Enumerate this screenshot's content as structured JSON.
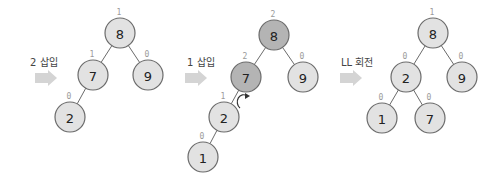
{
  "colors": {
    "node_fill": "#e2e2e2",
    "node_fill_unbalanced": "#b4b4b4",
    "edge": "#6b6b6b",
    "balance_factor_text": "#9a9a9a",
    "step_arrow": "#d4d4d4"
  },
  "steps": [
    {
      "label": "2 삽입",
      "nodes": [
        {
          "id": "p1-8",
          "value": "8",
          "bf": "1",
          "unbalanced": false
        },
        {
          "id": "p1-7",
          "value": "7",
          "bf": "1",
          "unbalanced": false
        },
        {
          "id": "p1-9",
          "value": "9",
          "bf": "0",
          "unbalanced": false
        },
        {
          "id": "p1-2",
          "value": "2",
          "bf": "0",
          "unbalanced": false
        }
      ],
      "edges": [
        [
          "p1-8",
          "p1-7"
        ],
        [
          "p1-8",
          "p1-9"
        ],
        [
          "p1-7",
          "p1-2"
        ]
      ]
    },
    {
      "label": "1 삽입",
      "nodes": [
        {
          "id": "p2-8",
          "value": "8",
          "bf": "2",
          "unbalanced": true
        },
        {
          "id": "p2-7",
          "value": "7",
          "bf": "2",
          "unbalanced": true
        },
        {
          "id": "p2-9",
          "value": "9",
          "bf": "0",
          "unbalanced": false
        },
        {
          "id": "p2-2",
          "value": "2",
          "bf": "1",
          "unbalanced": false
        },
        {
          "id": "p2-1",
          "value": "1",
          "bf": "0",
          "unbalanced": false
        }
      ],
      "edges": [
        [
          "p2-8",
          "p2-7"
        ],
        [
          "p2-8",
          "p2-9"
        ],
        [
          "p2-7",
          "p2-2"
        ],
        [
          "p2-2",
          "p2-1"
        ]
      ],
      "rotation_marker": "rotate-right-icon"
    },
    {
      "label": "LL 회전",
      "nodes": [
        {
          "id": "p3-8",
          "value": "8",
          "bf": "1",
          "unbalanced": false
        },
        {
          "id": "p3-2",
          "value": "2",
          "bf": "0",
          "unbalanced": false
        },
        {
          "id": "p3-9",
          "value": "9",
          "bf": "0",
          "unbalanced": false
        },
        {
          "id": "p3-1",
          "value": "1",
          "bf": "0",
          "unbalanced": false
        },
        {
          "id": "p3-7",
          "value": "7",
          "bf": "0",
          "unbalanced": false
        }
      ],
      "edges": [
        [
          "p3-8",
          "p3-2"
        ],
        [
          "p3-8",
          "p3-9"
        ],
        [
          "p3-2",
          "p3-1"
        ],
        [
          "p3-2",
          "p3-7"
        ]
      ]
    }
  ]
}
